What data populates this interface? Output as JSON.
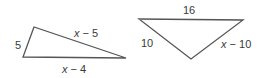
{
  "diagram": {
    "type": "geometry-triangles",
    "stroke_color": "#555555",
    "label_color": "#3a3a3a",
    "triangles": [
      {
        "id": "triangle-1",
        "vertices": [
          [
            34,
            27
          ],
          [
            23,
            57
          ],
          [
            126,
            58
          ]
        ],
        "sides": {
          "left": {
            "label_num": "5",
            "x": 17,
            "y": 49
          },
          "upper": {
            "var": "x",
            "op": " − ",
            "num": "5",
            "x": 74,
            "y": 37
          },
          "bottom": {
            "var": "x",
            "op": " − ",
            "num": "4",
            "x": 63,
            "y": 74
          }
        }
      },
      {
        "id": "triangle-2",
        "vertices": [
          [
            139,
            19
          ],
          [
            243,
            20
          ],
          [
            191,
            59
          ]
        ],
        "sides": {
          "top": {
            "label_num": "16",
            "x": 183,
            "y": 14
          },
          "left": {
            "label_num": "10",
            "x": 142,
            "y": 47
          },
          "right": {
            "var": "x",
            "op": " − ",
            "num": "10",
            "x": 221,
            "y": 48
          }
        }
      }
    ]
  }
}
